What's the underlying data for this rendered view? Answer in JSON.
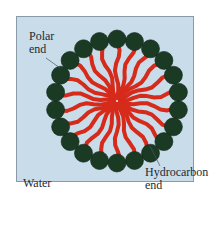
{
  "diagram": {
    "type": "micelle",
    "background_color": "#c9dcea",
    "head_color": "#1b3a24",
    "tail_color": "#d62a1a",
    "center": [
      117,
      101
    ],
    "ring_radius": 62,
    "head_radius": 9,
    "head_count": 22,
    "labels": {
      "polar_line1": "Polar",
      "polar_line2": "end",
      "hydrocarbon_line1": "Hydrocarbon",
      "hydrocarbon_line2": "end",
      "medium": "Water"
    }
  }
}
